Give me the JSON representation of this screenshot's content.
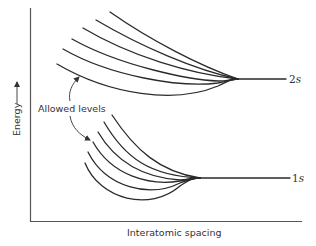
{
  "figure": {
    "x_axis_label": "Interatomic spacing",
    "y_axis_label": "Energy",
    "y_axis_arrow": "arrow-up",
    "annotation": "Allowed levels",
    "bands": [
      {
        "name": "upper-band",
        "level_number": "2",
        "level_letter": "s",
        "num_curves": 6
      },
      {
        "name": "lower-band",
        "level_number": "1",
        "level_letter": "s",
        "num_curves": 6
      }
    ],
    "colors": {
      "line": "#2a2a2a",
      "axis": "#555555",
      "text": "#333333",
      "background": "#ffffff"
    }
  }
}
